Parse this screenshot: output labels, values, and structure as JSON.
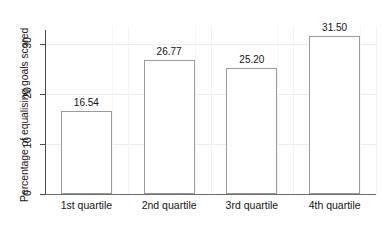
{
  "chart_data": {
    "type": "bar",
    "title": "",
    "subtitle": "",
    "xlabel": "",
    "ylabel": "Percentage of equalising goals scored",
    "categories": [
      "1st quartile",
      "2nd quartile",
      "3rd quartile",
      "4th quartile"
    ],
    "values": [
      16.54,
      26.77,
      25.2,
      31.5
    ],
    "value_labels": [
      "16.54",
      "26.77",
      "25.20",
      "31.50"
    ],
    "ylim": [
      0,
      33.5
    ],
    "yticks": [
      0,
      10,
      20,
      30
    ],
    "ytick_labels": [
      "0",
      "10",
      "20",
      "30"
    ],
    "grid": "horizontal and vertical light gridlines",
    "legend": "none",
    "bar_fill_color": "#ffffff",
    "bar_edge_color": "#9a9a9a",
    "axis_color": "#4a4a4a",
    "background_color": "#ffffff"
  }
}
